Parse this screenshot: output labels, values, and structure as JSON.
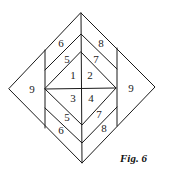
{
  "figure": {
    "caption": "Fig. 6",
    "regions": [
      {
        "label": "1",
        "x": 73,
        "y": 75
      },
      {
        "label": "2",
        "x": 90,
        "y": 75
      },
      {
        "label": "3",
        "x": 73,
        "y": 98
      },
      {
        "label": "4",
        "x": 91,
        "y": 98
      },
      {
        "label": "5",
        "x": 67,
        "y": 59
      },
      {
        "label": "7",
        "x": 96,
        "y": 59
      },
      {
        "label": "6",
        "x": 61,
        "y": 43
      },
      {
        "label": "8",
        "x": 101,
        "y": 43
      },
      {
        "label": "5",
        "x": 67,
        "y": 117
      },
      {
        "label": "7",
        "x": 99,
        "y": 114
      },
      {
        "label": "6",
        "x": 61,
        "y": 130
      },
      {
        "label": "8",
        "x": 104,
        "y": 128
      },
      {
        "label": "9",
        "x": 32,
        "y": 89
      },
      {
        "label": "9",
        "x": 131,
        "y": 88
      }
    ]
  }
}
